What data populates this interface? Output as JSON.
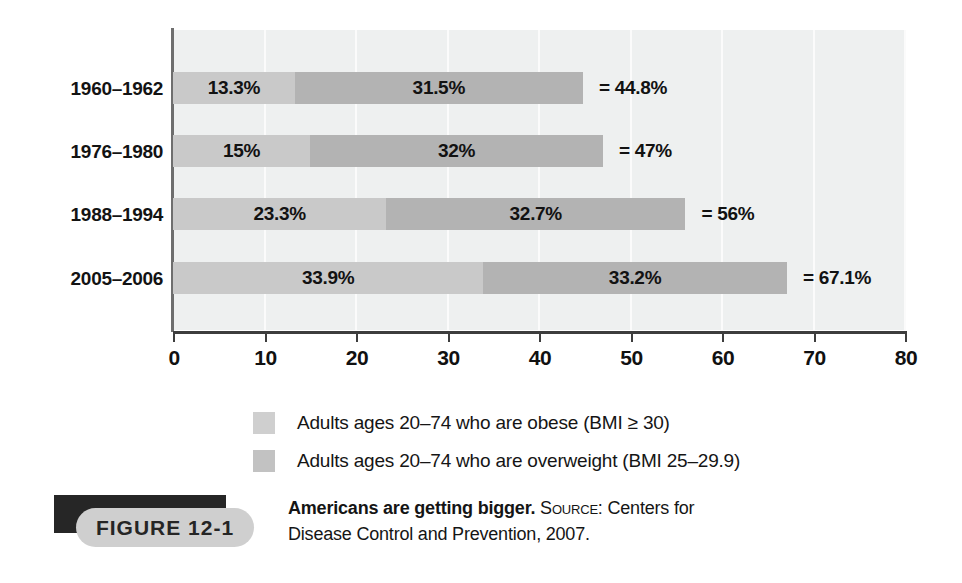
{
  "chart_data": {
    "type": "bar",
    "orientation": "horizontal",
    "stacked": true,
    "title": "Americans are getting bigger.",
    "xlabel": "",
    "ylabel": "",
    "xlim": [
      0,
      80
    ],
    "xticks": [
      0,
      10,
      20,
      30,
      40,
      50,
      60,
      70,
      80
    ],
    "xtick_labels": [
      "0",
      "10",
      "20",
      "30",
      "40",
      "50",
      "60",
      "70",
      "80"
    ],
    "grid": true,
    "grid_axis": "x",
    "legend_position": "below",
    "categories": [
      "1960–1962",
      "1976–1980",
      "1988–1994",
      "2005–2006"
    ],
    "series": [
      {
        "name": "Adults ages 20–74 who are obese (BMI ≥ 30)",
        "key": "obese",
        "color": "#c9c9c9",
        "values": [
          13.3,
          15,
          23.3,
          33.9
        ],
        "labels": [
          "13.3%",
          "15%",
          "23.3%",
          "33.9%"
        ]
      },
      {
        "name": "Adults ages 20–74 who are overweight (BMI 25–29.9)",
        "key": "overweight",
        "color": "#b3b3b3",
        "values": [
          31.5,
          32,
          32.7,
          33.2
        ],
        "labels": [
          "31.5%",
          "32%",
          "32.7%",
          "33.2%"
        ]
      }
    ],
    "totals": [
      44.8,
      47,
      56,
      67.1
    ],
    "total_labels": [
      "= 44.8%",
      "= 47%",
      "= 56%",
      "= 67.1%"
    ]
  },
  "legend": {
    "items": [
      {
        "label": "Adults ages 20–74 who are obese (BMI ≥ 30)",
        "color": "#cfcfcf"
      },
      {
        "label": "Adults ages 20–74 who are overweight (BMI 25–29.9)",
        "color": "#c2c2c2"
      }
    ]
  },
  "caption": {
    "figure_label": "FIGURE  12-1",
    "title": "Americans are getting bigger.",
    "source_label": "Source:",
    "source_text": " Centers for Disease Control and Prevention, 2007."
  },
  "colors": {
    "plot_background": "#eef0f0",
    "gridline": "#fbfbfb",
    "axis": "#3d3d3d",
    "obese": "#c9c9c9",
    "overweight": "#b3b3b3",
    "figure_tag_shadow": "#262626",
    "figure_tag_pill": "#cfcfcf"
  }
}
